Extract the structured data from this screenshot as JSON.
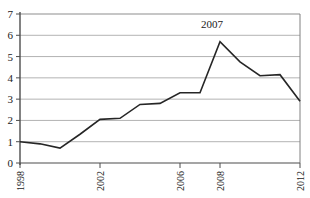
{
  "chart_data": {
    "type": "line",
    "title": "",
    "xlabel": "",
    "ylabel": "",
    "xlim": [
      1998,
      2012
    ],
    "ylim": [
      0,
      7
    ],
    "grid": true,
    "grid_axis": "y",
    "legend": "none",
    "line_color": "#262626",
    "grid_color": "#b3b3b3",
    "axis_color": "#4d4d4d",
    "background_color": "#ffffff",
    "ytick_labels": [
      "7",
      "6",
      "5",
      "4",
      "3",
      "2",
      "1",
      "0"
    ],
    "ytick_values": [
      7,
      6,
      5,
      4,
      3,
      2,
      1,
      0
    ],
    "xtick_labels": [
      "1998",
      "2002",
      "2006",
      "2008",
      "2012"
    ],
    "xtick_values": [
      1998,
      2002,
      2006,
      2008,
      2012
    ],
    "xtick_rotation": "90",
    "x": [
      1998,
      1999,
      2000,
      2001,
      2002,
      2003,
      2004,
      2005,
      2006,
      2007,
      2008,
      2009,
      2010,
      2011,
      2012
    ],
    "series": [
      {
        "name": "value",
        "values": [
          1.0,
          0.9,
          0.7,
          1.35,
          2.05,
          2.1,
          2.75,
          2.8,
          3.3,
          3.3,
          5.7,
          4.75,
          4.1,
          4.15,
          2.9
        ]
      }
    ],
    "annotations": [
      {
        "text": "2007",
        "x": 2007.6,
        "y": 6.35
      }
    ]
  }
}
